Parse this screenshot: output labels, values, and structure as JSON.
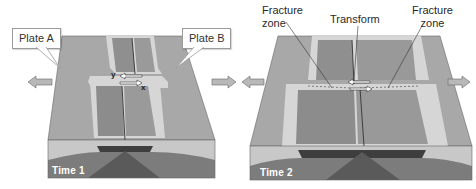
{
  "figure": {
    "panels": [
      {
        "id": "time-1",
        "time_label": "Time 1",
        "callouts": [
          {
            "id": "plate-a",
            "text": "Plate A"
          },
          {
            "id": "plate-b",
            "text": "Plate B"
          }
        ],
        "point_labels": {
          "y": "y",
          "x": "x"
        },
        "arrows": [
          "left-outward",
          "right-outward",
          "transform-opposing-pair"
        ]
      },
      {
        "id": "time-2",
        "time_label": "Time 2",
        "labels": {
          "fracture_zone_left": [
            "Fracture",
            "zone"
          ],
          "transform": "Transform",
          "fracture_zone_right": [
            "Fracture",
            "zone"
          ]
        },
        "arrows": [
          "left-outward",
          "right-outward",
          "transform-opposing-pair"
        ]
      }
    ],
    "colors": {
      "plate_surface": "#a9a9a9",
      "ridge_light": "#d9d9d9",
      "ridge_mid": "#8e8e8e",
      "crust_side": "#c4c4c4",
      "mantle": "#7a7a7a",
      "magma": "#4d4d4d",
      "arrow_fill": "#b5b5b5",
      "outline": "#555555"
    }
  }
}
